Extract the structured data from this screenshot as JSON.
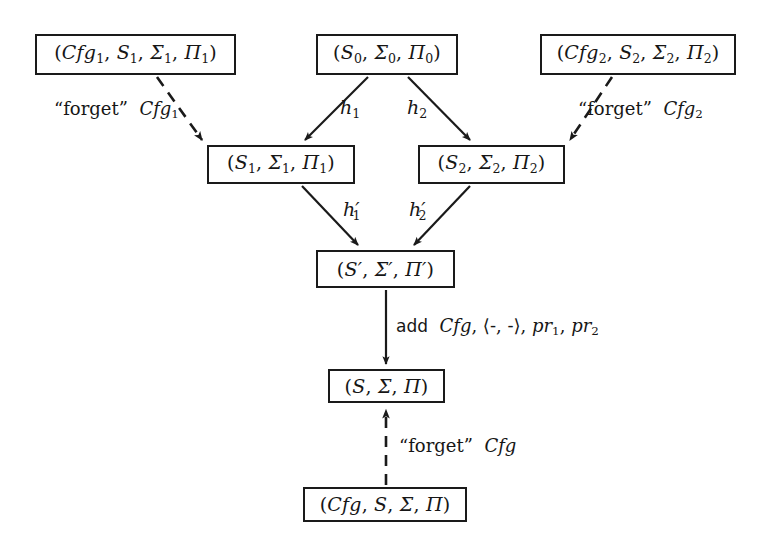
{
  "diagram": {
    "type": "commutative-diagram",
    "title": "",
    "background_color": "#ffffff",
    "stroke_color": "#1a1a1a",
    "nodes": [
      {
        "id": "cfg1",
        "label": "(Cfg₁, S₁, Σ₁, Π₁)",
        "x": 35,
        "y": 34,
        "w": 201,
        "h": 41
      },
      {
        "id": "s0",
        "label": "(S₀, Σ₀, Π₀)",
        "x": 316,
        "y": 34,
        "w": 142,
        "h": 41
      },
      {
        "id": "cfg2",
        "label": "(Cfg₂, S₂, Σ₂, Π₂)",
        "x": 540,
        "y": 34,
        "w": 196,
        "h": 41
      },
      {
        "id": "s1",
        "label": "(S₁, Σ₁, Π₁)",
        "x": 207,
        "y": 145,
        "w": 148,
        "h": 39
      },
      {
        "id": "s2",
        "label": "(S₂, Σ₂, Π₂)",
        "x": 418,
        "y": 145,
        "w": 147,
        "h": 39
      },
      {
        "id": "sprime",
        "label": "(S′, Σ′, Π′)",
        "x": 316,
        "y": 250,
        "w": 139,
        "h": 38
      },
      {
        "id": "s",
        "label": "(S, Σ, Π)",
        "x": 328,
        "y": 369,
        "w": 117,
        "h": 34
      },
      {
        "id": "cfg",
        "label": "(Cfg, S, Σ, Π)",
        "x": 303,
        "y": 487,
        "w": 164,
        "h": 35
      }
    ],
    "edges": [
      {
        "id": "forget-cfg1",
        "from": "cfg1",
        "to": "s1",
        "style": "dashed",
        "label": "“forget” Cfg₁"
      },
      {
        "id": "h1",
        "from": "s0",
        "to": "s1",
        "style": "solid",
        "label": "h₁"
      },
      {
        "id": "h2",
        "from": "s0",
        "to": "s2",
        "style": "solid",
        "label": "h₂"
      },
      {
        "id": "forget-cfg2",
        "from": "cfg2",
        "to": "s2",
        "style": "dashed",
        "label": "“forget” Cfg₂"
      },
      {
        "id": "h1prime",
        "from": "s1",
        "to": "sprime",
        "style": "solid",
        "label": "h′₁"
      },
      {
        "id": "h2prime",
        "from": "s2",
        "to": "sprime",
        "style": "solid",
        "label": "h′₂"
      },
      {
        "id": "add",
        "from": "sprime",
        "to": "s",
        "style": "solid",
        "label": "add Cfg, ⟨-, -⟩, pr₁, pr₂"
      },
      {
        "id": "forget-cfg",
        "from": "cfg",
        "to": "s",
        "style": "dashed",
        "label": "“forget” Cfg"
      }
    ],
    "labels": {
      "forget_cfg1": {
        "quote": "“forget”",
        "symbol": "Cfg",
        "sub": "1"
      },
      "forget_cfg2": {
        "quote": "“forget”",
        "symbol": "Cfg",
        "sub": "2"
      },
      "forget_cfg": {
        "quote": "“forget”",
        "symbol": "Cfg",
        "sub": ""
      },
      "h1": {
        "base": "h",
        "sub": "1",
        "prime": ""
      },
      "h2": {
        "base": "h",
        "sub": "2",
        "prime": ""
      },
      "h1p": {
        "base": "h",
        "sub": "1",
        "prime": "′"
      },
      "h2p": {
        "base": "h",
        "sub": "2",
        "prime": "′"
      },
      "add": {
        "word": "add",
        "rest_a": "Cfg",
        "rest_b": ", ⟨-, -⟩, ",
        "pr": "pr",
        "pr1": "1",
        "pr2": "2"
      }
    }
  }
}
